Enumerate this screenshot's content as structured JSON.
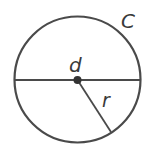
{
  "diagram": {
    "labels": {
      "circumference": "C",
      "diameter": "d",
      "radius": "r"
    },
    "colors": {
      "stroke": "#4a4a4a",
      "center_dot": "#333333",
      "text": "#3a3a3a",
      "background": "#ffffff"
    },
    "geometry": {
      "center": [
        77.5,
        79.5
      ],
      "radius": 63,
      "radius_end": [
        111,
        132
      ]
    }
  }
}
